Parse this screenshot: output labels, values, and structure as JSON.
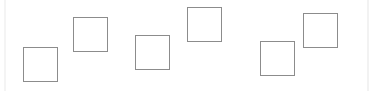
{
  "canvas": {
    "width": 381,
    "height": 91,
    "background": "#ffffff"
  },
  "boxes": [
    {
      "x": 23,
      "y": 47,
      "w": 35,
      "h": 35,
      "stroke": "#8c8c8c"
    },
    {
      "x": 73,
      "y": 17,
      "w": 35,
      "h": 35,
      "stroke": "#8c8c8c"
    },
    {
      "x": 135,
      "y": 35,
      "w": 35,
      "h": 35,
      "stroke": "#8c8c8c"
    },
    {
      "x": 187,
      "y": 7,
      "w": 35,
      "h": 35,
      "stroke": "#8c8c8c"
    },
    {
      "x": 260,
      "y": 41,
      "w": 35,
      "h": 35,
      "stroke": "#8c8c8c"
    },
    {
      "x": 303,
      "y": 13,
      "w": 35,
      "h": 35,
      "stroke": "#8c8c8c"
    }
  ]
}
